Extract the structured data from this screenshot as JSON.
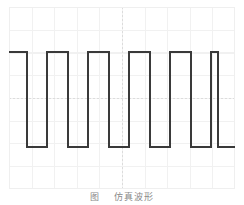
{
  "figure": {
    "caption_number": "图",
    "caption_text": "仿真波形",
    "background_color": "#ffffff"
  },
  "plot": {
    "frame_color": "#efefef",
    "grid_color": "#f1f1f1",
    "axis_color": "#dcdcdc",
    "trace_color": "#3a3a3a",
    "trace_width": 2,
    "grid_divisions_x": 10,
    "grid_divisions_y": 8
  },
  "chart_data": {
    "type": "line",
    "title": "",
    "subtitle": "",
    "xlabel": "",
    "ylabel": "",
    "xlim": [
      0,
      226
    ],
    "ylim": [
      0,
      182
    ],
    "grid": true,
    "legend": null,
    "waveform": "square",
    "cycles": 5,
    "duty_cycle_percent": 50,
    "high_level": 45,
    "low_level": 140,
    "period_px": 41,
    "series": [
      {
        "name": "square-wave",
        "color": "#3a3a3a",
        "x": [
          0,
          18,
          18,
          38,
          38,
          59,
          59,
          79,
          79,
          100,
          100,
          120,
          120,
          141,
          141,
          161,
          161,
          182,
          182,
          202,
          202,
          209,
          209,
          226
        ],
        "y": [
          45,
          45,
          140,
          140,
          45,
          45,
          140,
          140,
          45,
          45,
          140,
          140,
          45,
          45,
          140,
          140,
          45,
          45,
          140,
          140,
          45,
          45,
          140,
          140
        ]
      }
    ],
    "annotations": []
  }
}
